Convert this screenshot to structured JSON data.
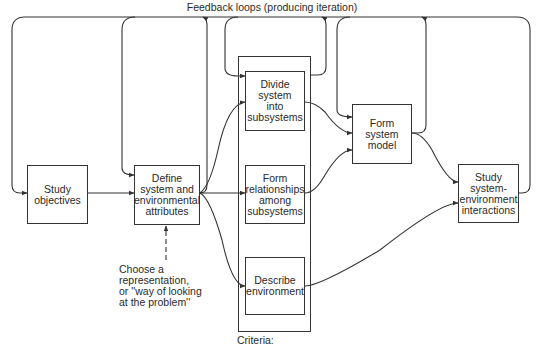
{
  "title": "Feedback loops (producing iteration)",
  "nodes": {
    "study_objectives": "Study\nobjectives",
    "define_system": "Define\nsystem and\nenvironmental\nattributes",
    "divide_system": "Divide\nsystem\ninto\nsubsystems",
    "form_relationships": "Form\nrelationships\namong\nsubsystems",
    "describe_environment": "Describe\nenvironment",
    "form_system_model": "Form\nsystem\nmodel",
    "study_interactions": "Study\nsystem-\nenvironment\ninteractions"
  },
  "annotations": {
    "choose_representation": "Choose a\nrepresentation,\nor ''way of looking\nat the problem''",
    "criteria": "Criteria:"
  },
  "colors": {
    "line": "#333333",
    "background": "#ffffff"
  }
}
